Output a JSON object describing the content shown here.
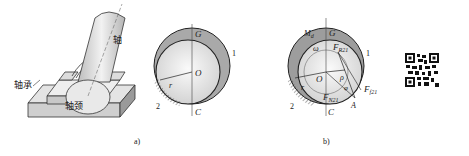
{
  "figure": {
    "panels": [
      {
        "id": "a",
        "caption": "a)",
        "perspective_labels": {
          "shaft": "轴",
          "bearing": "轴承",
          "journal": "轴颈"
        },
        "cross_section_labels": {
          "top": "G",
          "center": "O",
          "bottom": "C",
          "radius": "r",
          "outer_part": "1",
          "ground_part": "2"
        }
      },
      {
        "id": "b",
        "caption": "b)",
        "labels": {
          "moment": "M",
          "moment_sub": "d",
          "top": "G",
          "omega": "ω",
          "force_r": "F",
          "force_r_sub": "R21",
          "center": "O",
          "rho": "ρ",
          "phi": "φ",
          "radius": "r",
          "force_n": "F",
          "force_n_sub": "N21",
          "force_f": "F",
          "force_f_sub": "f21",
          "point_a": "A",
          "bottom": "C",
          "outer_part": "1",
          "ground_part": "2"
        }
      }
    ],
    "qr_code": {
      "name": "qr-code"
    }
  }
}
